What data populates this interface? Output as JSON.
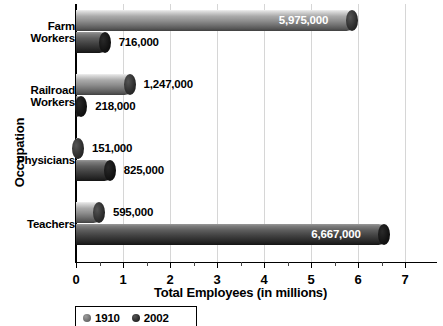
{
  "chart_data": {
    "type": "bar",
    "orientation": "horizontal",
    "title": "",
    "xlabel": "Total Employees (in millions)",
    "ylabel": "Occupation",
    "xlim": [
      0,
      7
    ],
    "xticks": [
      0,
      1,
      2,
      3,
      4,
      5,
      6,
      7
    ],
    "xticklabels": [
      "0",
      "1",
      "2",
      "3",
      "4",
      "5",
      "6",
      "7"
    ],
    "minor_xticks": [
      0.5,
      1.5,
      2.5,
      3.5,
      4.5,
      5.5,
      6.5
    ],
    "grid": "vertical",
    "legend_position": "bottom-left",
    "categories": [
      "Farm Workers",
      "Railroad Workers",
      "Physicians",
      "Teachers"
    ],
    "category_lines": [
      [
        "Farm",
        "Workers"
      ],
      [
        "Railroad",
        "Workers"
      ],
      [
        "Physicians"
      ],
      [
        "Teachers"
      ]
    ],
    "series": [
      {
        "name": "1910",
        "color": "#8e8e8e",
        "values": [
          5975000,
          1247000,
          151000,
          595000
        ],
        "values_millions": [
          5.975,
          1.247,
          0.151,
          0.595
        ],
        "labels": [
          "5,975,000",
          "1,247,000",
          "151,000",
          "595,000"
        ],
        "label_placement": [
          "inside",
          "outside",
          "outside",
          "outside"
        ]
      },
      {
        "name": "2002",
        "color": "#303030",
        "values": [
          716000,
          218000,
          825000,
          6667000
        ],
        "values_millions": [
          0.716,
          0.218,
          0.825,
          6.667
        ],
        "labels": [
          "716,000",
          "218,000",
          "825,000",
          "6,667,000"
        ],
        "label_placement": [
          "outside",
          "outside",
          "outside",
          "inside"
        ]
      }
    ]
  },
  "legend": {
    "entries": [
      {
        "label": "1910",
        "marker": "circle-marker-1910"
      },
      {
        "label": "2002",
        "marker": "circle-marker-2002"
      }
    ]
  }
}
